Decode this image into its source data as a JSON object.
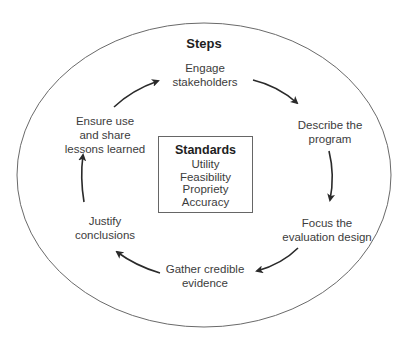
{
  "diagram": {
    "outer_title": "Steps",
    "steps": [
      {
        "label_line1": "Engage",
        "label_line2": "stakeholders"
      },
      {
        "label_line1": "Describe the",
        "label_line2": "program"
      },
      {
        "label_line1": "Focus the",
        "label_line2": "evaluation design"
      },
      {
        "label_line1": "Gather credible",
        "label_line2": "evidence"
      },
      {
        "label_line1": "Justify",
        "label_line2": "conclusions"
      },
      {
        "label_line1": "Ensure use",
        "label_line2": "and share",
        "label_line3": "lessons learned"
      }
    ],
    "standards": {
      "title": "Standards",
      "items": [
        "Utility",
        "Feasibility",
        "Propriety",
        "Accuracy"
      ]
    },
    "colors": {
      "ellipse": "#6a6a6a",
      "arrow": "#2a2a2a",
      "text": "#3c3c3c"
    }
  }
}
